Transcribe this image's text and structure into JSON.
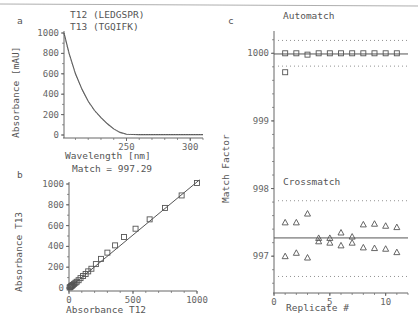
{
  "chart_data": [
    {
      "panel": "a",
      "type": "line",
      "title_lines": [
        "T12 (LEDGSPR)",
        "T13 (TGQIFK)"
      ],
      "xlabel": "Wavelength [nm]",
      "ylabel": "Absorbance [mAU]",
      "xticks": [
        250,
        300
      ],
      "yticks": [
        0,
        200,
        400,
        600,
        800,
        1000
      ],
      "xlim": [
        201,
        310
      ],
      "ylim": [
        0,
        1000
      ],
      "series": [
        {
          "name": "T12 (LEDGSPR)",
          "x": [
            201,
            205,
            210,
            215,
            220,
            225,
            230,
            235,
            240,
            245,
            250,
            260,
            280,
            310
          ],
          "y": [
            1000,
            800,
            600,
            450,
            330,
            240,
            170,
            110,
            60,
            25,
            8,
            4,
            4,
            4
          ]
        },
        {
          "name": "T13 (TGQIFK)",
          "x": [
            201,
            205,
            210,
            215,
            220,
            225,
            230,
            235,
            240,
            245,
            250,
            260,
            280,
            310
          ],
          "y": [
            990,
            790,
            595,
            445,
            325,
            235,
            165,
            105,
            58,
            24,
            8,
            4,
            4,
            4
          ]
        }
      ],
      "annotation": "Match = 997.29"
    },
    {
      "panel": "b",
      "type": "scatter",
      "xlabel": "Absorbance T12",
      "ylabel": "Absorbance T13",
      "xticks": [
        0,
        500,
        1000
      ],
      "yticks": [
        0,
        200,
        400,
        600,
        800,
        1000
      ],
      "xlim": [
        0,
        1000
      ],
      "ylim": [
        0,
        1000
      ],
      "series": [
        {
          "name": "points",
          "x": [
            5,
            10,
            15,
            20,
            25,
            30,
            40,
            50,
            60,
            75,
            90,
            110,
            130,
            150,
            175,
            210,
            250,
            300,
            360,
            430,
            520,
            630,
            750,
            880,
            1000
          ],
          "y": [
            5,
            10,
            15,
            20,
            25,
            30,
            40,
            50,
            60,
            75,
            95,
            115,
            135,
            160,
            185,
            230,
            280,
            340,
            410,
            490,
            570,
            660,
            770,
            890,
            1010
          ]
        },
        {
          "name": "fit line",
          "x": [
            0,
            1020
          ],
          "y": [
            0,
            1040
          ]
        }
      ]
    },
    {
      "panel": "c",
      "type": "scatter",
      "xlabel": "Replicate #",
      "ylabel": "Match Factor",
      "xticks": [
        0,
        5,
        10
      ],
      "yticks": [
        997,
        998,
        999,
        1000
      ],
      "xlim": [
        0,
        12
      ],
      "ylim": [
        996.5,
        1000.3
      ],
      "annotations": [
        "Automatch",
        "Crossmatch"
      ],
      "series": [
        {
          "name": "Automatch",
          "marker": "square",
          "x": [
            1,
            2,
            3,
            4,
            5,
            6,
            7,
            8,
            9,
            10,
            11,
            1
          ],
          "y": [
            1000,
            1000,
            999.98,
            1000,
            1000,
            1000,
            1000,
            1000,
            1000,
            1000,
            1000,
            999.72
          ]
        },
        {
          "name": "Automatch mean",
          "value": 999.99,
          "style": "solid"
        },
        {
          "name": "Automatch limits",
          "values": [
            1000.19,
            999.81
          ],
          "style": "dotted"
        },
        {
          "name": "Crossmatch",
          "marker": "triangle",
          "x": [
            1,
            2,
            3,
            4,
            5,
            6,
            7,
            8,
            9,
            10,
            11,
            1,
            2,
            3,
            4,
            5,
            6,
            7,
            8,
            9,
            10,
            11
          ],
          "y": [
            997.5,
            997.5,
            997.63,
            997.27,
            997.27,
            997.35,
            997.29,
            997.47,
            997.48,
            997.45,
            997.43,
            997.0,
            997.05,
            996.98,
            997.22,
            997.2,
            997.16,
            997.2,
            997.13,
            997.12,
            997.11,
            997.06
          ]
        },
        {
          "name": "Crossmatch mean",
          "value": 997.27,
          "style": "solid"
        },
        {
          "name": "Crossmatch limits",
          "values": [
            997.82,
            996.7
          ],
          "style": "dotted"
        }
      ]
    }
  ],
  "labels": {
    "panel_a": "a",
    "panel_b": "b",
    "panel_c": "c",
    "a_title1": "T12 (LEDGSPR)",
    "a_title2": "T13 (TGQIFK)",
    "a_xlabel": "Wavelength [nm]",
    "a_ylabel": "Absorbance [mAU]",
    "match": "Match = 997.29",
    "b_xlabel": "Absorbance T12",
    "b_ylabel": "Absorbance T13",
    "c_xlabel": "Replicate #",
    "c_ylabel": "Match Factor",
    "automatch": "Automatch",
    "crossmatch": "Crossmatch",
    "a_yt": [
      "0",
      "200",
      "400",
      "600",
      "800",
      "1000"
    ],
    "a_xt": [
      "250",
      "300"
    ],
    "b_yt": [
      "0",
      "200",
      "400",
      "600",
      "800",
      "1000"
    ],
    "b_xt": [
      "0",
      "500",
      "1000"
    ],
    "c_yt": [
      "997",
      "998",
      "999",
      "1000"
    ],
    "c_xt": [
      "0",
      "5",
      "10"
    ]
  }
}
